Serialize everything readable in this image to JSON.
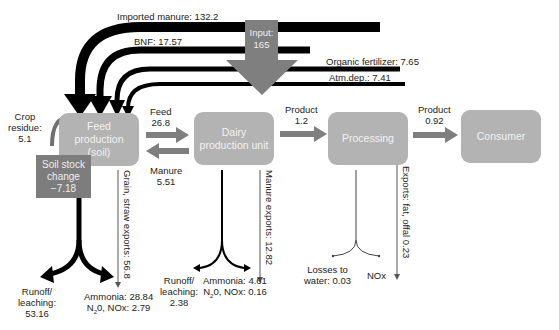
{
  "diagram": {
    "type": "nitrogen-flow",
    "nodes": {
      "feed_production": {
        "line1": "Feed",
        "line2": "production",
        "line3": "(soil)"
      },
      "dairy_production": {
        "line1": "Dairy",
        "line2": "production unit"
      },
      "processing": {
        "label": "Processing"
      },
      "consumer": {
        "label": "Consumer"
      },
      "soil_stock": {
        "line1": "Soil stock",
        "line2": "change",
        "line3": "−7.18"
      }
    },
    "input": {
      "line1": "Input:",
      "line2": "165"
    },
    "inputs": {
      "imported_manure": "Imported manure: 132.2",
      "bnf": "BNF: 17.57",
      "organic_fertilizer": "Organic fertilizer: 7.65",
      "atm_dep": "Atm.dep.: 7.41"
    },
    "crop_residue": {
      "line1": "Crop",
      "line2": "residue:",
      "line3": "5.1"
    },
    "flows": {
      "feed": {
        "line1": "Feed",
        "line2": "26.8"
      },
      "manure": {
        "line1": "Manure",
        "line2": "5.51"
      },
      "product1": {
        "line1": "Product",
        "line2": "1.2"
      },
      "product2": {
        "line1": "Product",
        "line2": "0.92"
      }
    },
    "exports": {
      "grain_straw": "Grain, straw exports: 56.8",
      "manure": "Manure exports: 12.82",
      "fat_offal": "Exports: fat, offal 0.23"
    },
    "losses": {
      "feed_runoff": {
        "line1": "Runoff/",
        "line2": "leaching:",
        "line3": "53.16"
      },
      "feed_ammonia": {
        "line1": "Ammonia: 28.84",
        "line2_pre": "N",
        "line2_sub": "2",
        "line2_post": "0, NOx: 2.79"
      },
      "dairy_runoff": {
        "line1": "Runoff/",
        "line2": "leaching:",
        "line3": "2.38"
      },
      "dairy_ammonia": {
        "line1": "Ammonia: 4.61",
        "line2_pre": "N",
        "line2_sub": "2",
        "line2_post": "0, NOx: 0.16"
      },
      "proc_water": {
        "line1": "Losses to",
        "line2": "water: 0.03"
      },
      "proc_nox": "NOx"
    },
    "colors": {
      "box": "#b3b3b3",
      "soil_box": "#7d7d7d",
      "arrow_gray": "#7f7f7f",
      "arrow_black": "#000000"
    }
  }
}
